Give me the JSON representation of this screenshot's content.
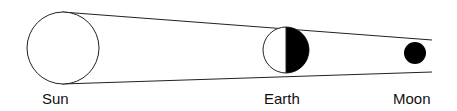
{
  "diagram": {
    "type": "eclipse-geometry",
    "labels": {
      "sun": "Sun",
      "earth": "Earth",
      "moon": "Moon"
    },
    "colors": {
      "stroke": "#111111",
      "fill_dark": "#000000",
      "fill_light": "#ffffff"
    }
  }
}
